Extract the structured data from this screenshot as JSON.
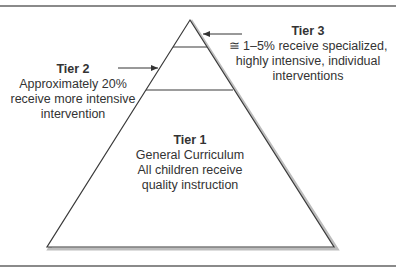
{
  "diagram": {
    "type": "pyramid",
    "colors": {
      "outline": "#3a3a3a",
      "shadow": "#b5b5b5",
      "rule": "#8a8a8a",
      "fill": "#ffffff"
    },
    "tiers": [
      {
        "title": "Tier 3",
        "lines": [
          "≅ 1–5% receive specialized,",
          "highly intensive, individual",
          "interventions"
        ]
      },
      {
        "title": "Tier 2",
        "lines": [
          "Approximately 20%",
          "receive more intensive",
          "intervention"
        ]
      },
      {
        "title": "Tier 1",
        "lines": [
          "General Curriculum",
          "All children receive",
          "quality instruction"
        ]
      }
    ]
  }
}
